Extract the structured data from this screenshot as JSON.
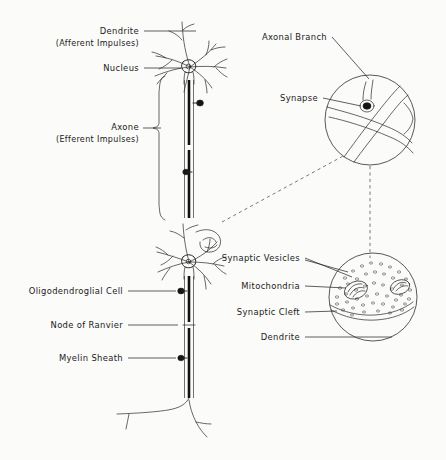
{
  "figure": {
    "style": "hand-drawn ink line art",
    "background_color": "#fbfbf9",
    "ink_color": "#262626"
  },
  "labels": {
    "dendrite": {
      "line1": "Dendrite",
      "line2": "(Afferent Impulses)"
    },
    "nucleus": "Nucleus",
    "axon": {
      "line1": "Axone",
      "line2": "(Efferent Impulses)"
    },
    "oligodendroglial_cell": "Oligodendroglial Cell",
    "node_of_ranvier": "Node of Ranvier",
    "myelin_sheath": "Myelin Sheath",
    "axonal_branch": "Axonal Branch",
    "synapse": "Synapse",
    "synaptic_vesicles": "Synaptic Vesicles",
    "mitochondria": "Mitochondria",
    "synaptic_cleft": "Synaptic Cleft",
    "dendrite_detail": "Dendrite"
  }
}
